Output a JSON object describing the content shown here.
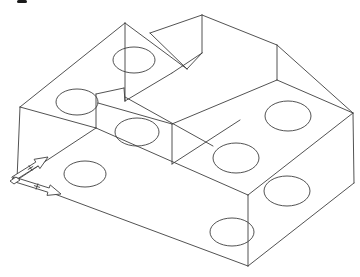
{
  "app": {
    "description": "CAD wireframe isometric drawing of a stepped machine block with drilled holes",
    "background_color": "#ffffff",
    "line_color": "#3e3e3e",
    "line_width": 0.9,
    "canvas_width": 360,
    "canvas_height": 277
  },
  "chart_data": {
    "type": "table",
    "segments": [
      [
        20,
        107,
        125,
        23
      ],
      [
        125,
        23,
        187,
        69
      ],
      [
        187,
        69,
        202,
        53
      ],
      [
        202,
        15,
        202,
        53
      ],
      [
        202,
        15,
        150,
        33
      ],
      [
        150,
        33,
        187,
        69
      ],
      [
        202,
        15,
        277,
        45
      ],
      [
        277,
        45,
        353,
        113
      ],
      [
        353,
        113,
        354,
        183
      ],
      [
        354,
        183,
        248,
        266
      ],
      [
        248,
        266,
        17,
        180
      ],
      [
        17,
        180,
        20,
        107
      ],
      [
        125,
        23,
        125,
        101
      ],
      [
        202,
        53,
        172,
        73
      ],
      [
        172,
        73,
        125,
        101
      ],
      [
        20,
        107,
        96,
        128
      ],
      [
        96,
        94,
        96,
        128
      ],
      [
        96,
        94,
        124,
        88
      ],
      [
        124,
        88,
        125,
        101
      ],
      [
        125,
        97,
        213,
        146
      ],
      [
        98,
        103,
        172,
        124
      ],
      [
        172,
        124,
        172,
        164
      ],
      [
        277,
        80,
        172,
        124
      ],
      [
        277,
        45,
        277,
        80
      ],
      [
        277,
        80,
        353,
        113
      ],
      [
        353,
        113,
        248,
        195
      ],
      [
        248,
        195,
        248,
        266
      ],
      [
        96,
        128,
        248,
        195
      ],
      [
        96,
        128,
        17,
        180
      ],
      [
        172,
        164,
        240,
        120
      ]
    ],
    "holes": [
      {
        "cx": 77,
        "cy": 102,
        "rx": 21,
        "ry": 13
      },
      {
        "cx": 134,
        "cy": 60,
        "rx": 21,
        "ry": 13
      },
      {
        "cx": 137,
        "cy": 132,
        "rx": 22,
        "ry": 14
      },
      {
        "cx": 85,
        "cy": 174,
        "rx": 21,
        "ry": 13
      },
      {
        "cx": 288,
        "cy": 116,
        "rx": 23,
        "ry": 15
      },
      {
        "cx": 236,
        "cy": 158,
        "rx": 23,
        "ry": 15
      },
      {
        "cx": 287,
        "cy": 191,
        "rx": 23,
        "ry": 15
      },
      {
        "cx": 232,
        "cy": 232,
        "rx": 22,
        "ry": 14
      }
    ],
    "ucs_icon": {
      "origin": [
        13,
        179
      ],
      "x_axis_tip": [
        48,
        157
      ],
      "y_axis_tip": [
        61,
        194
      ],
      "shaft_half_width": 2.2,
      "head_length": 13,
      "head_half_width": 5.5,
      "tick_size": 3.2,
      "tick_position": 0.5
    }
  },
  "artifact": {
    "x": 17,
    "y": 0,
    "width": 10,
    "height": 3,
    "color": "#1a1a1a"
  }
}
